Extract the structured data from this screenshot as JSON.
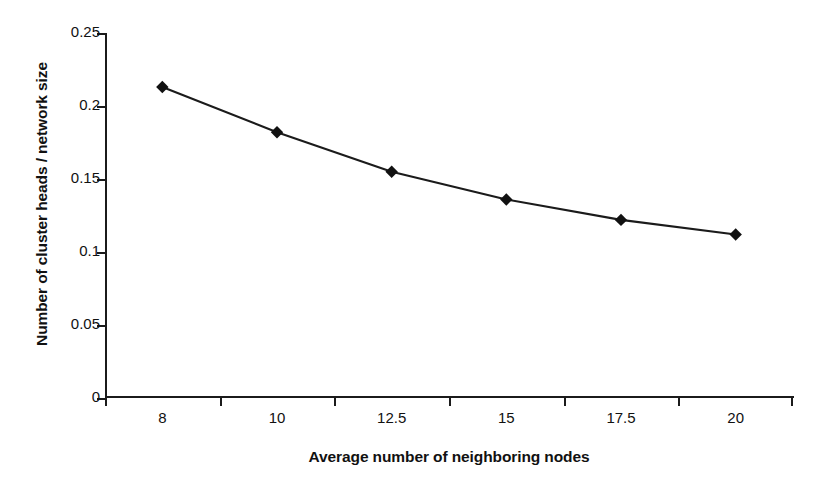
{
  "chart_data": {
    "type": "line",
    "title": "",
    "subtitle": "",
    "xlabel": "Average number of neighboring nodes",
    "ylabel": "Number of cluster heads / network size",
    "categories": [
      "8",
      "10",
      "12.5",
      "15",
      "17.5",
      "20"
    ],
    "values": [
      0.213,
      0.182,
      0.155,
      0.136,
      0.122,
      0.112
    ],
    "series": [
      {
        "name": "cluster head ratio",
        "values": [
          0.213,
          0.182,
          0.155,
          0.136,
          0.122,
          0.112
        ]
      }
    ],
    "ylim": [
      0,
      0.25
    ],
    "y_ticks": [
      "0",
      "0.05",
      "0.1",
      "0.15",
      "0.2",
      "0.25"
    ],
    "y_tick_values": [
      0,
      0.05,
      0.1,
      0.15,
      0.2,
      0.25
    ],
    "x_tick_style": "category-boundaries",
    "grid": false,
    "legend": false,
    "legend_position": "none",
    "marker": "diamond",
    "colors": {
      "line": "#1b1b1b",
      "marker": "#111111",
      "axis": "#1b1b1b",
      "background": "#ffffff",
      "text": "#111111"
    }
  }
}
